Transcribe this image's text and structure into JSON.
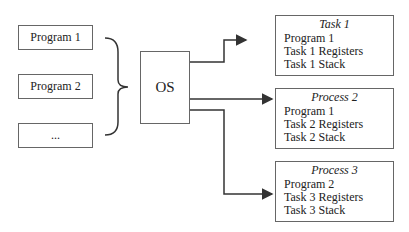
{
  "programs": [
    {
      "label": "Program 1"
    },
    {
      "label": "Program 2"
    },
    {
      "label": "..."
    }
  ],
  "os": {
    "label": "OS"
  },
  "tasks": [
    {
      "title": "Task 1",
      "lines": [
        "Program 1",
        "Task 1 Registers",
        "Task 1 Stack"
      ]
    },
    {
      "title": "Process 2",
      "lines": [
        "Program 1",
        "Task 2 Registers",
        "Task 2 Stack"
      ]
    },
    {
      "title": "Process 3",
      "lines": [
        "Program 2",
        "Task 3 Registers",
        "Task 3 Stack"
      ]
    }
  ],
  "colors": {
    "line": "#333333",
    "border": "#666666"
  }
}
